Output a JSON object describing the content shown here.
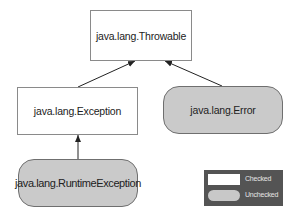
{
  "diagram": {
    "nodes": [
      {
        "id": "throwable",
        "label": "java.lang.Throwable",
        "kind": "checked"
      },
      {
        "id": "exception",
        "label": "java.lang.Exception",
        "kind": "checked"
      },
      {
        "id": "error",
        "label": "java.lang.Error",
        "kind": "unchecked"
      },
      {
        "id": "runtime",
        "label": "java.lang.RuntimeException",
        "kind": "unchecked"
      }
    ],
    "edges": [
      {
        "from": "exception",
        "to": "throwable"
      },
      {
        "from": "error",
        "to": "throwable"
      },
      {
        "from": "runtime",
        "to": "exception"
      }
    ],
    "legend": {
      "checked_label": "Checked",
      "unchecked_label": "Unchecked"
    },
    "colors": {
      "checked_fill": "#ffffff",
      "unchecked_fill": "#cacaca",
      "legend_bg": "#545454",
      "edge": "#222222"
    }
  }
}
